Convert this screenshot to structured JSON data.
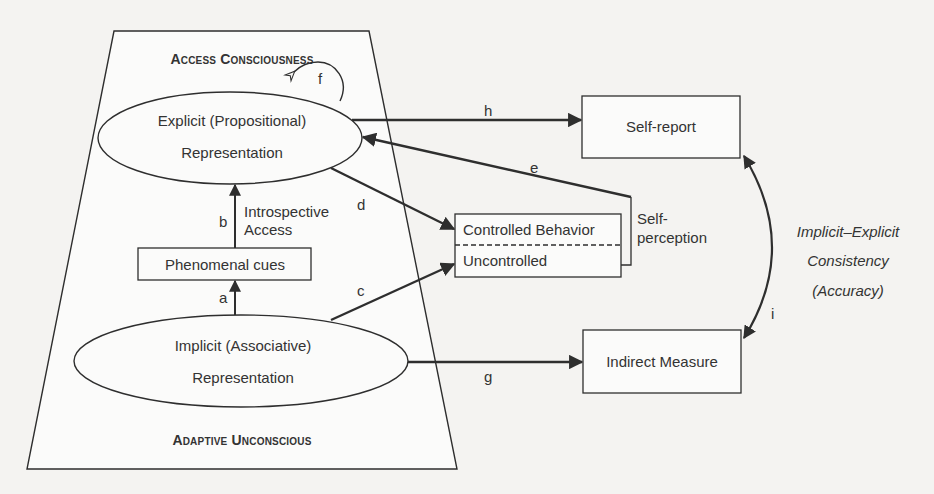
{
  "diagram": {
    "regions": {
      "access_consciousness": "Access Consciousness",
      "adaptive_unconscious": "Adaptive Unconscious"
    },
    "nodes": {
      "explicit": {
        "line1": "Explicit (Propositional)",
        "line2": "Representation"
      },
      "implicit": {
        "line1": "Implicit (Associative)",
        "line2": "Representation"
      },
      "phenomenal_cues": "Phenomenal cues",
      "behavior": {
        "controlled": "Controlled Behavior",
        "uncontrolled": "Uncontrolled"
      },
      "self_report": "Self-report",
      "indirect_measure": "Indirect Measure"
    },
    "annotations": {
      "introspective_access": {
        "line1": "Introspective",
        "line2": "Access"
      },
      "self_perception": {
        "line1": "Self-",
        "line2": "perception"
      },
      "consistency": {
        "line1": "Implicit–Explicit",
        "line2": "Consistency",
        "line3": "(Accuracy)"
      }
    },
    "edges": {
      "a": "a",
      "b": "b",
      "c": "c",
      "d": "d",
      "e": "e",
      "f": "f",
      "g": "g",
      "h": "h",
      "i": "i"
    },
    "colors": {
      "stroke": "#2e2e2e",
      "background": "#f4f3f1",
      "text": "#333333"
    }
  }
}
